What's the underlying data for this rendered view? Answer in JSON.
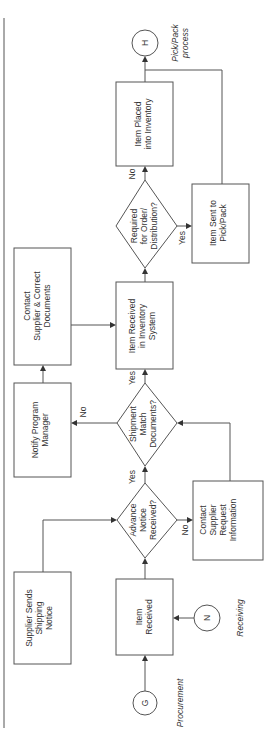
{
  "diagram": {
    "type": "flowchart",
    "orientation": "rotated-90-ccw",
    "connectors": {
      "G": {
        "label": "G",
        "caption": "Procurement"
      },
      "N": {
        "label": "N",
        "caption": "Receiving"
      },
      "H": {
        "label": "H",
        "caption_line1": "Pick/Pack",
        "caption_line2": "process"
      }
    },
    "processes": {
      "supplier_sends": {
        "lines": [
          "Supplier Sends",
          "Shipping",
          "Notice"
        ]
      },
      "item_received": {
        "lines": [
          "Item",
          "Received"
        ]
      },
      "contact_supplier_request": {
        "lines": [
          "Contact",
          "Supplier",
          "Request",
          "Information"
        ]
      },
      "notify_pm": {
        "lines": [
          "Notify Program",
          "Manager"
        ]
      },
      "contact_supplier_correct": {
        "lines": [
          "Contact",
          "Supplier & Correct",
          "Documents"
        ]
      },
      "item_received_inventory": {
        "lines": [
          "Item Received",
          "in Inventory",
          "System"
        ]
      },
      "item_sent_pick": {
        "lines": [
          "Item Sent to",
          "Pick/Pack"
        ]
      },
      "item_placed": {
        "lines": [
          "Item Placed",
          "into Inventory"
        ]
      }
    },
    "decisions": {
      "advance_notice": {
        "lines": [
          "Advance",
          "Notice",
          "Received?"
        ],
        "yes": "Yes",
        "no": "No"
      },
      "shipment_match": {
        "lines": [
          "Shipment",
          "Match",
          "Documents?"
        ],
        "yes": "Yes",
        "no": "No"
      },
      "required_order": {
        "lines": [
          "Required",
          "for Order/",
          "Distribution?"
        ],
        "yes": "Yes",
        "no": "No"
      }
    }
  }
}
